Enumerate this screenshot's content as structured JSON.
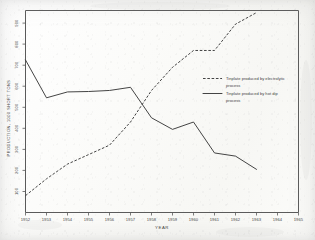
{
  "chart_data": {
    "type": "line",
    "title": "",
    "xlabel": "YEAR",
    "ylabel": "PRODUCTION, 1000 SHORT TONS",
    "xlim": [
      1952,
      1965
    ],
    "ylim": [
      0,
      960
    ],
    "grid": false,
    "legend_position": "center-right",
    "x_ticks": [
      "1952",
      "1953",
      "1954",
      "1955",
      "1956",
      "1957",
      "1958",
      "1959",
      "1960",
      "1961",
      "1962",
      "1963",
      "1964",
      "1965"
    ],
    "y_ticks": [
      "100",
      "200",
      "300",
      "400",
      "500",
      "600",
      "700",
      "800",
      "900"
    ],
    "series": [
      {
        "name": "Tinplate produced by electrolytic process",
        "style": "dashed",
        "x": [
          1952,
          1953,
          1954,
          1955,
          1956,
          1957,
          1958,
          1959,
          1960,
          1961,
          1962,
          1963
        ],
        "values": [
          80,
          160,
          230,
          275,
          320,
          430,
          580,
          690,
          770,
          770,
          895,
          950
        ]
      },
      {
        "name": "Tinplate produced by hot dip process",
        "style": "solid",
        "x": [
          1952,
          1953,
          1954,
          1955,
          1956,
          1957,
          1958,
          1959,
          1960,
          1961,
          1962,
          1963
        ],
        "values": [
          725,
          545,
          573,
          575,
          580,
          595,
          450,
          395,
          430,
          283,
          268,
          205
        ]
      }
    ],
    "annotations": []
  },
  "legend": {
    "entries": [
      {
        "label_line1": "Tinplate produced by electrolytic",
        "label_line2": "process",
        "style": "dashed"
      },
      {
        "label_line1": "Tinplate produced by hot dip",
        "label_line2": "process",
        "style": "solid"
      }
    ]
  },
  "axes": {
    "x_title": "YEAR",
    "y_title": "PRODUCTION, 1000 SHORT TONS"
  }
}
